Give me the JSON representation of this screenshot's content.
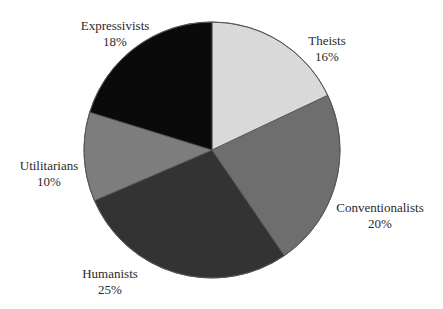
{
  "chart_data": {
    "type": "pie",
    "title": "",
    "start_angle_deg": 0,
    "direction": "clockwise",
    "center": [
      212,
      150
    ],
    "radius": 128,
    "outline_color": "#555555",
    "slices": [
      {
        "label": "Theists",
        "value": 16,
        "value_label": "16%",
        "color": "#d9d9d9",
        "label_pos": [
          327,
          33
        ]
      },
      {
        "label": "Conventionalists",
        "value": 20,
        "value_label": "20%",
        "color": "#6e6e6e",
        "label_pos": [
          380,
          200
        ]
      },
      {
        "label": "Humanists",
        "value": 25,
        "value_label": "25%",
        "color": "#333333",
        "label_pos": [
          110,
          266
        ]
      },
      {
        "label": "Utilitarians",
        "value": 10,
        "value_label": "10%",
        "color": "#7d7d7d",
        "label_pos": [
          49,
          158
        ]
      },
      {
        "label": "Expressivists",
        "value": 18,
        "value_label": "18%",
        "color": "#0a0a0a",
        "label_pos": [
          115,
          18
        ]
      }
    ],
    "legend": "none",
    "labels_outside": true
  }
}
